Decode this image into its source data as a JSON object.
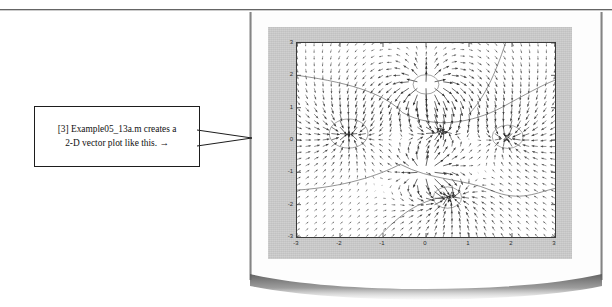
{
  "page": {
    "kind": "scanned-textbook-page",
    "background_color": "#ffffff",
    "rule_color": "#4a4a4a"
  },
  "callout": {
    "line1": "[3] Example05_13a.m creates a",
    "line2": "2-D vector plot like this.  →",
    "border_color": "#1d1d1d",
    "background_color": "#ffffff",
    "leader_target": "figure"
  },
  "figure": {
    "panel_color": "#c9c9c9",
    "axes_background": "#ffffff",
    "axes_border_color": "#3b3b3b",
    "marker": {
      "name": "square-marker",
      "x": 0.3,
      "y": 0.3
    }
  },
  "chart_data": {
    "type": "scatter",
    "plot_kind": "quiver-vector-field",
    "title": "",
    "xlabel": "",
    "ylabel": "",
    "xlim": [
      -3,
      3
    ],
    "ylim": [
      -3,
      3
    ],
    "xticks": [
      -3,
      -2,
      -1,
      0,
      1,
      2,
      3
    ],
    "yticks": [
      -3,
      -2,
      -1,
      0,
      1,
      2,
      3
    ],
    "xticklabels": [
      "-3",
      "-2",
      "-1",
      "0",
      "1",
      "2",
      "3"
    ],
    "yticklabels": [
      "-3",
      "-2",
      "-1",
      "0",
      "1",
      "2",
      "3"
    ],
    "grid": false,
    "legend": null,
    "legend_position": "none",
    "series": [
      {
        "name": "vector-field",
        "kind": "quiver",
        "grid_nx": 31,
        "grid_ny": 31,
        "color": "#2b2b2b",
        "description": "2-D vector field arrows on a uniform 31x31 grid over x,y in [-3,3]"
      },
      {
        "name": "contour-lines",
        "kind": "contour",
        "color": "#555555",
        "description": "Light contour curves crossing the field"
      }
    ],
    "sources": [
      {
        "x": 0.0,
        "y": 1.7,
        "strength": 1.0,
        "label": "upper-sink"
      },
      {
        "x": 0.0,
        "y": -1.0,
        "strength": 0.9,
        "label": "lower-sink"
      },
      {
        "x": -1.8,
        "y": 0.2,
        "strength": -0.7,
        "label": "left-source"
      },
      {
        "x": 0.35,
        "y": 0.3,
        "strength": -0.8,
        "label": "center-source"
      },
      {
        "x": 1.9,
        "y": 0.1,
        "strength": -0.6,
        "label": "right-source"
      },
      {
        "x": 0.5,
        "y": -1.75,
        "strength": -0.9,
        "label": "lower-source"
      }
    ]
  }
}
